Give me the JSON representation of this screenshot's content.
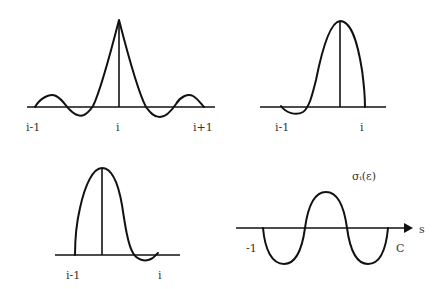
{
  "panels": [
    {
      "id": "top-left",
      "description": "symmetric peaked basis function centered at i",
      "labels": {
        "left": "i-1",
        "center": "i",
        "right": "i+1"
      }
    },
    {
      "id": "top-right",
      "description": "asymmetric hump with negative lobe near i-1",
      "labels": {
        "left": "i-1",
        "right": "i"
      }
    },
    {
      "id": "bottom-left",
      "description": "asymmetric hump with negative lobe near i",
      "labels": {
        "left": "i-1",
        "right": "i"
      }
    },
    {
      "id": "bottom-right",
      "description": "oscillating function along s axis",
      "labels": {
        "left": "-1",
        "right": "C",
        "axis": "s",
        "function": "σᵢ(ε)"
      }
    }
  ],
  "colors": {
    "stroke": "#111111",
    "label": "#333333",
    "background": "#ffffff"
  }
}
